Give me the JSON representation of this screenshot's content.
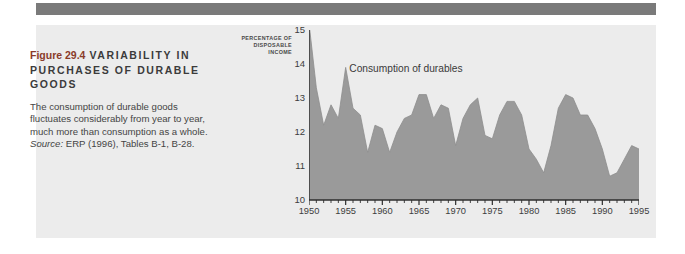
{
  "page": {
    "background_color": "#ffffff",
    "panel_color": "#ececec",
    "rule_color": "#7a7a7a"
  },
  "caption": {
    "figure_number": "Figure 29.4",
    "title": "VARIABILITY IN PURCHASES OF DURABLE GOODS",
    "title_color": "#3b3b3b",
    "figure_number_color": "#8a3b2a",
    "body": "The consumption of durable goods fluctuates considerably from year to year, much more than consumption as a whole.",
    "source_label": "Source:",
    "source_text": " ERP (1996), Tables B-1, B-28."
  },
  "chart_data": {
    "type": "area",
    "title": "",
    "subtitle": "",
    "xlabel": "",
    "ylabel": "PERCENTAGE OF DISPOSABLE INCOME",
    "ylabel_lines": [
      "PERCENTAGE OF",
      "DISPOSABLE",
      "INCOME"
    ],
    "series_label": "Consumption of durables",
    "series_color": "#9a9a9a",
    "grid": false,
    "legend": "inline-annotation",
    "xlim": [
      1950,
      1995
    ],
    "ylim": [
      10,
      15
    ],
    "yticks": [
      10,
      11,
      12,
      13,
      14,
      15
    ],
    "ytick_labels": [
      "10",
      "11",
      "12",
      "13",
      "14",
      "15"
    ],
    "xticks": [
      1950,
      1955,
      1960,
      1965,
      1970,
      1975,
      1980,
      1985,
      1990,
      1995
    ],
    "xtick_labels": [
      "1950",
      "1955",
      "1960",
      "1965",
      "1970",
      "1975",
      "1980",
      "1985",
      "1990",
      "1995"
    ],
    "minor_tick_interval": 1,
    "x": [
      1950,
      1951,
      1952,
      1953,
      1954,
      1955,
      1956,
      1957,
      1958,
      1959,
      1960,
      1961,
      1962,
      1963,
      1964,
      1965,
      1966,
      1967,
      1968,
      1969,
      1970,
      1971,
      1972,
      1973,
      1974,
      1975,
      1976,
      1977,
      1978,
      1979,
      1980,
      1981,
      1982,
      1983,
      1984,
      1985,
      1986,
      1987,
      1988,
      1989,
      1990,
      1991,
      1992,
      1993,
      1994,
      1995
    ],
    "series": [
      {
        "name": "Consumption of durables",
        "values": [
          15.2,
          13.3,
          12.2,
          12.8,
          12.4,
          13.9,
          12.7,
          12.5,
          11.4,
          12.2,
          12.1,
          11.4,
          12.0,
          12.4,
          12.5,
          13.1,
          13.1,
          12.4,
          12.8,
          12.7,
          11.6,
          12.4,
          12.8,
          13.0,
          11.9,
          11.8,
          12.5,
          12.9,
          12.9,
          12.5,
          11.5,
          11.2,
          10.8,
          11.6,
          12.7,
          13.1,
          13.0,
          12.5,
          12.5,
          12.1,
          11.5,
          10.7,
          10.8,
          11.2,
          11.6,
          11.5
        ]
      }
    ]
  }
}
